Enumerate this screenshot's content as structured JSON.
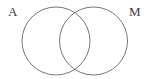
{
  "figure": {
    "type": "venn-diagram",
    "background_color": "#ffffff",
    "width": 149,
    "height": 79,
    "stroke_color": "#777777",
    "stroke_width": 1,
    "label_color": "#3a3a3a",
    "label_font_size": 13
  },
  "sets": [
    {
      "id": "left",
      "label": "A",
      "label_position": "top-left",
      "center_x": 56,
      "center_y": 41,
      "radius": 34
    },
    {
      "id": "right",
      "label": "M",
      "label_position": "top-right",
      "center_x": 93.5,
      "center_y": 41,
      "radius": 34
    }
  ],
  "intersection": {
    "upper_point_x": 75,
    "upper_point_y": 13,
    "lower_point_x": 75,
    "lower_point_y": 69,
    "shaded": false,
    "label": ""
  }
}
